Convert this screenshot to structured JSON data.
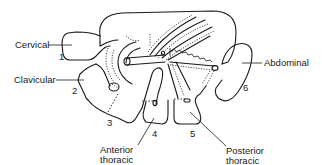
{
  "figure": {
    "type": "anatomical line drawing",
    "labels": {
      "cervical": "Cervical",
      "clavicular": "Clavicular",
      "abdominal": "Abdominal",
      "anterior_thoracic_line1": "Anterior",
      "anterior_thoracic_line2": "thoracic",
      "posterior_thoracic_line1": "Posterior",
      "posterior_thoracic_line2": "thoracic"
    },
    "numbers": {
      "n1": "1",
      "n2": "2",
      "n3": "3",
      "n4": "4",
      "n5": "5",
      "n6": "6"
    },
    "stroke_color": "#1a1a1a",
    "background": "#ffffff"
  }
}
